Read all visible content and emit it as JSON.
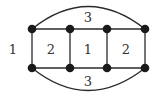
{
  "diagram": {
    "type": "planar-graph",
    "colors": {
      "edge": "#2a2a2a",
      "vertex": "#1a1a1a",
      "label": "#333333",
      "background": "#ffffff"
    },
    "vertices": [
      {
        "id": "a",
        "x": 32,
        "y": 29
      },
      {
        "id": "b",
        "x": 70,
        "y": 29
      },
      {
        "id": "c",
        "x": 107,
        "y": 29
      },
      {
        "id": "d",
        "x": 145,
        "y": 29
      },
      {
        "id": "e",
        "x": 32,
        "y": 68
      },
      {
        "id": "f",
        "x": 70,
        "y": 68
      },
      {
        "id": "g",
        "x": 107,
        "y": 68
      },
      {
        "id": "h",
        "x": 145,
        "y": 68
      }
    ],
    "edges": [
      [
        "a",
        "b"
      ],
      [
        "b",
        "c"
      ],
      [
        "c",
        "d"
      ],
      [
        "e",
        "f"
      ],
      [
        "f",
        "g"
      ],
      [
        "g",
        "h"
      ],
      [
        "a",
        "e"
      ],
      [
        "b",
        "f"
      ],
      [
        "c",
        "g"
      ],
      [
        "d",
        "h"
      ],
      [
        "a",
        "d",
        "arc-top"
      ],
      [
        "e",
        "h",
        "arc-bottom"
      ]
    ],
    "face_labels": {
      "top": "3",
      "bottom": "3",
      "outer_left": "1",
      "square1": "2",
      "square2": "1",
      "square3": "2"
    }
  }
}
